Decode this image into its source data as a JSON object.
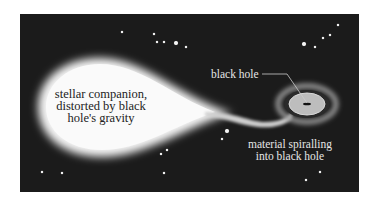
{
  "diagram": {
    "labels": {
      "companion": [
        "stellar companion,",
        "distorted by black",
        "hole's gravity"
      ],
      "black_hole": "black hole",
      "material": [
        "material spiralling",
        "into black hole"
      ]
    },
    "colors": {
      "background": "#1b1b1b",
      "star": "#f2f2f2",
      "disk": "#bdbdbd",
      "leader_line": "#cccccc"
    },
    "stars": [
      [
        122,
        32
      ],
      [
        154,
        34
      ],
      [
        157,
        42
      ],
      [
        164,
        42
      ],
      [
        176,
        43
      ],
      [
        186,
        47
      ],
      [
        338,
        25
      ],
      [
        330,
        35
      ],
      [
        323,
        38
      ],
      [
        304,
        44
      ],
      [
        315,
        47
      ],
      [
        42,
        172
      ],
      [
        62,
        173
      ],
      [
        161,
        154
      ],
      [
        167,
        150
      ],
      [
        164,
        173
      ],
      [
        227,
        131
      ],
      [
        222,
        139
      ],
      [
        320,
        172
      ],
      [
        306,
        180
      ]
    ]
  }
}
